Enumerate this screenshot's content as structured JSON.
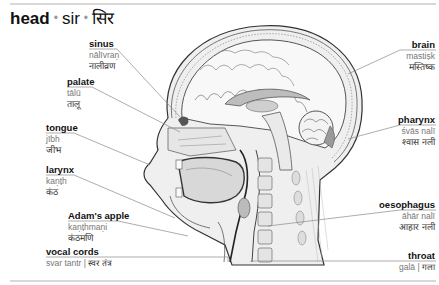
{
  "title": {
    "english": "head",
    "romanized": "sir",
    "hindi": "सिर",
    "separator": "•"
  },
  "labels": [
    {
      "id": "sinus",
      "english": "sinus",
      "romanized": "nālīvraṇ",
      "hindi": "नालीव्रण",
      "side": "left"
    },
    {
      "id": "palate",
      "english": "palate",
      "romanized": "tālū",
      "hindi": "तालू",
      "side": "left"
    },
    {
      "id": "tongue",
      "english": "tongue",
      "romanized": "jībh",
      "hindi": "जीभ",
      "side": "left"
    },
    {
      "id": "larynx",
      "english": "larynx",
      "romanized": "kaṇṭh",
      "hindi": "कंठ",
      "side": "left"
    },
    {
      "id": "adams-apple",
      "english": "Adam's apple",
      "romanized": "kaṇṭhmaṇi",
      "hindi": "कंठमणि",
      "side": "left"
    },
    {
      "id": "vocal-cords",
      "english": "vocal cords",
      "romanized": "svar tantr",
      "hindi": "स्वर तंत्र",
      "side": "left"
    },
    {
      "id": "brain",
      "english": "brain",
      "romanized": "mastiṣk",
      "hindi": "मस्तिष्क",
      "side": "right"
    },
    {
      "id": "pharynx",
      "english": "pharynx",
      "romanized": "śvās nalī",
      "hindi": "श्वास नली",
      "side": "right"
    },
    {
      "id": "oesophagus",
      "english": "oesophagus",
      "romanized": "āhār nalī",
      "hindi": "आहार नली",
      "side": "right"
    },
    {
      "id": "throat",
      "english": "throat",
      "romanized": "galā",
      "hindi": "गला",
      "side": "right"
    }
  ],
  "inline_separator": "|",
  "colors": {
    "rule": "#d8d8d8",
    "leader": "#8a8a8a",
    "text_english": "#111111",
    "text_romanized": "#777777"
  }
}
